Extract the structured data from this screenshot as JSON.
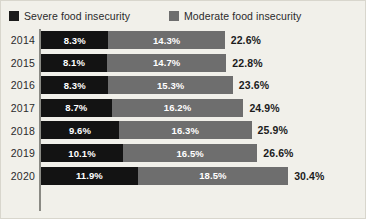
{
  "legend": {
    "items": [
      {
        "label": "Severe food insecurity",
        "color": "#131313",
        "icon": "square-swatch-icon"
      },
      {
        "label": "Moderate food insecurity",
        "color": "#6e6e6e",
        "icon": "square-swatch-icon"
      }
    ]
  },
  "chart_data": {
    "type": "bar",
    "orientation": "horizontal",
    "stacked": true,
    "title": "",
    "subtitle": "",
    "xlabel": "",
    "ylabel": "",
    "categories": [
      "2014",
      "2015",
      "2016",
      "2017",
      "2018",
      "2019",
      "2020"
    ],
    "series": [
      {
        "name": "Severe food insecurity",
        "color": "#131313",
        "values": [
          8.3,
          8.1,
          8.3,
          8.7,
          9.6,
          10.1,
          11.9
        ],
        "labels": [
          "8.3%",
          "8.1%",
          "8.3%",
          "8.7%",
          "9.6%",
          "10.1%",
          "11.9%"
        ]
      },
      {
        "name": "Moderate food insecurity",
        "color": "#6e6e6e",
        "values": [
          14.3,
          14.7,
          15.3,
          16.2,
          16.3,
          16.5,
          18.5
        ],
        "labels": [
          "14.3%",
          "14.7%",
          "15.3%",
          "16.2%",
          "16.3%",
          "16.5%",
          "18.5%"
        ]
      }
    ],
    "totals": [
      22.6,
      22.8,
      23.6,
      24.9,
      25.9,
      26.6,
      30.4
    ],
    "total_labels": [
      "22.6%",
      "22.8%",
      "23.6%",
      "24.9%",
      "25.9%",
      "26.6%",
      "30.4%"
    ],
    "xlim": [
      0,
      30.4
    ],
    "grid": false,
    "legend_position": "top"
  },
  "rows": [
    {
      "year": "2014",
      "severe": "8.3%",
      "moderate": "14.3%",
      "total": "22.6%"
    },
    {
      "year": "2015",
      "severe": "8.1%",
      "moderate": "14.7%",
      "total": "22.8%"
    },
    {
      "year": "2016",
      "severe": "8.3%",
      "moderate": "15.3%",
      "total": "23.6%"
    },
    {
      "year": "2017",
      "severe": "8.7%",
      "moderate": "16.2%",
      "total": "24.9%"
    },
    {
      "year": "2018",
      "severe": "9.6%",
      "moderate": "16.3%",
      "total": "25.9%"
    },
    {
      "year": "2019",
      "severe": "10.1%",
      "moderate": "16.5%",
      "total": "26.6%"
    },
    {
      "year": "2020",
      "severe": "11.9%",
      "moderate": "18.5%",
      "total": "30.4%"
    }
  ],
  "layout": {
    "px_per_percent": 8.13,
    "bar_start_x": 40,
    "row_height": 22.6,
    "bar_height": 18,
    "total_gap": 6
  },
  "colors": {
    "background": "#f1f0ea",
    "border": "#d8d6cd",
    "axis": "#8a8a84",
    "severe": "#131313",
    "moderate": "#6e6e6e",
    "text": "#2a2a2a"
  }
}
